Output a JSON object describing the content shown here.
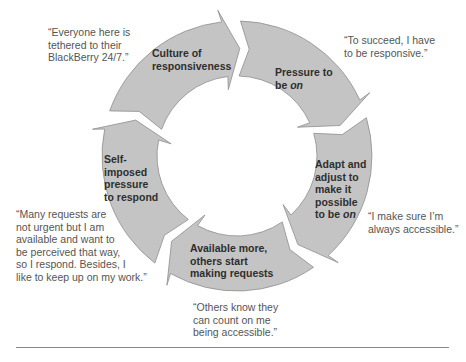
{
  "diagram": {
    "type": "cycle",
    "center": [
      237,
      156
    ],
    "outer_radius": 135,
    "inner_radius": 80,
    "fill_color": "#c4c4c4",
    "stroke_color": "#8e8e8e",
    "steps": [
      {
        "label_lines": [
          "Culture of",
          "responsiveness"
        ],
        "italic_word": null,
        "quote_lines": [
          "“Everyone here is",
          "tethered to their",
          "BlackBerry 24/7.”"
        ]
      },
      {
        "label_lines": [
          "Pressure to",
          "be "
        ],
        "italic_word": "on",
        "quote_lines": [
          "“To succeed, I have",
          "to be responsive.”"
        ]
      },
      {
        "label_lines": [
          "Adapt and",
          "adjust to",
          "make it",
          "possible",
          "to be "
        ],
        "italic_word": "on",
        "quote_lines": [
          "“I make sure I’m",
          "always accessible.”"
        ]
      },
      {
        "label_lines": [
          "Available more,",
          "others start",
          "making requests"
        ],
        "italic_word": null,
        "quote_lines": [
          "“Others know they",
          "can count on me",
          "being accessible.”"
        ]
      },
      {
        "label_lines": [
          "Self-",
          "imposed",
          "pressure",
          "to respond"
        ],
        "italic_word": null,
        "quote_lines": [
          "“Many requests are",
          "not urgent but I am",
          "available and want to",
          "be perceived that way,",
          "so I respond. Besides, I",
          "like to keep up on my work.”"
        ]
      }
    ]
  }
}
